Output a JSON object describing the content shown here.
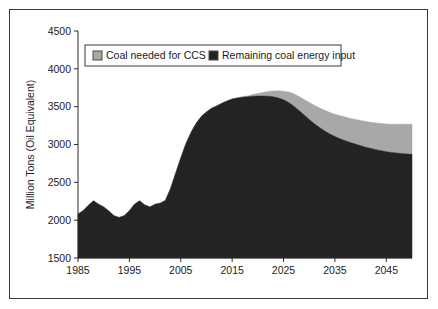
{
  "chart_data": {
    "type": "area",
    "stacked": true,
    "title": "",
    "xlabel": "",
    "ylabel": "Million Tons (Oil Equivalent)",
    "xlim": [
      1985,
      2050
    ],
    "ylim": [
      1500,
      4500
    ],
    "ytick_labels": [
      "4500",
      "4000",
      "3500",
      "3000",
      "2500",
      "2000",
      "1500"
    ],
    "yticks": [
      4500,
      4000,
      3500,
      3000,
      2500,
      2000,
      1500
    ],
    "xtick_labels": [
      "1985",
      "1995",
      "2005",
      "2015",
      "2025",
      "2035",
      "2045"
    ],
    "xticks": [
      1985,
      1995,
      2005,
      2015,
      2025,
      2035,
      2045
    ],
    "grid": false,
    "legend_position": "top-left-inside",
    "colors": {
      "ccs": "#a8a8a8",
      "remaining": "#232323",
      "axis": "#2a2a2a",
      "frame": "#3a3a3a",
      "text": "#1c1c1c",
      "background": "#ffffff"
    },
    "x": [
      1985,
      1986,
      1987,
      1988,
      1989,
      1990,
      1991,
      1992,
      1993,
      1994,
      1995,
      1996,
      1997,
      1998,
      1999,
      2000,
      2001,
      2002,
      2003,
      2004,
      2005,
      2006,
      2007,
      2008,
      2009,
      2010,
      2011,
      2012,
      2013,
      2014,
      2015,
      2016,
      2017,
      2018,
      2019,
      2020,
      2021,
      2022,
      2023,
      2024,
      2025,
      2026,
      2027,
      2028,
      2029,
      2030,
      2031,
      2032,
      2033,
      2034,
      2035,
      2036,
      2037,
      2038,
      2039,
      2040,
      2041,
      2042,
      2043,
      2044,
      2045,
      2046,
      2047,
      2048,
      2049,
      2050
    ],
    "series": [
      {
        "name": "Remaining coal energy input",
        "values": [
          2080,
          2125,
          2195,
          2255,
          2210,
          2175,
          2120,
          2060,
          2035,
          2060,
          2125,
          2210,
          2255,
          2200,
          2175,
          2210,
          2225,
          2260,
          2415,
          2620,
          2820,
          3010,
          3160,
          3280,
          3370,
          3430,
          3480,
          3510,
          3545,
          3575,
          3600,
          3615,
          3625,
          3630,
          3638,
          3640,
          3640,
          3638,
          3630,
          3615,
          3590,
          3555,
          3505,
          3450,
          3390,
          3330,
          3275,
          3225,
          3180,
          3140,
          3105,
          3075,
          3050,
          3025,
          3005,
          2985,
          2965,
          2948,
          2932,
          2918,
          2905,
          2895,
          2888,
          2880,
          2874,
          2870
        ]
      },
      {
        "name": "Coal needed for CCS",
        "values": [
          0,
          0,
          0,
          0,
          0,
          0,
          0,
          0,
          0,
          0,
          0,
          0,
          0,
          0,
          0,
          0,
          0,
          0,
          0,
          0,
          0,
          0,
          0,
          0,
          0,
          0,
          0,
          0,
          0,
          0,
          0,
          0,
          5,
          12,
          22,
          34,
          48,
          62,
          78,
          95,
          115,
          140,
          165,
          185,
          205,
          225,
          243,
          258,
          272,
          284,
          295,
          305,
          313,
          320,
          327,
          333,
          339,
          345,
          352,
          358,
          365,
          372,
          379,
          387,
          394,
          400
        ]
      }
    ],
    "legend": [
      {
        "label": "Coal needed for CCS",
        "swatch": "#a8a8a8"
      },
      {
        "label": "Remaining coal energy input",
        "swatch": "#232323"
      }
    ]
  }
}
